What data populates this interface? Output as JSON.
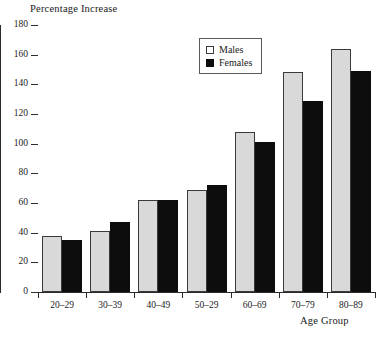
{
  "chart_data": {
    "type": "bar",
    "title": "",
    "ylabel": "Percentage Increase",
    "xlabel": "Age Group",
    "categories": [
      "20–29",
      "30–39",
      "40–49",
      "50–29",
      "60–69",
      "70–79",
      "80–89"
    ],
    "series": [
      {
        "name": "Males",
        "color": "#d9d9d9",
        "values": [
          38,
          41,
          62,
          69,
          108,
          148,
          164
        ]
      },
      {
        "name": "Females",
        "color": "#0d0d0d",
        "values": [
          35,
          47,
          62,
          72,
          101,
          129,
          149
        ]
      }
    ],
    "ylim": [
      0,
      180
    ],
    "yticks": [
      0,
      20,
      40,
      60,
      80,
      100,
      120,
      140,
      160,
      180
    ],
    "ytick_labels": [
      "0",
      "20",
      "40",
      "60",
      "80",
      "100",
      "120",
      "140",
      "160",
      "180"
    ],
    "grid": false,
    "legend_position": "top-center"
  },
  "legend": {
    "entries": [
      {
        "label": "Males",
        "swatch": "light-gray-square-icon"
      },
      {
        "label": "Females",
        "swatch": "black-square-icon"
      }
    ]
  }
}
